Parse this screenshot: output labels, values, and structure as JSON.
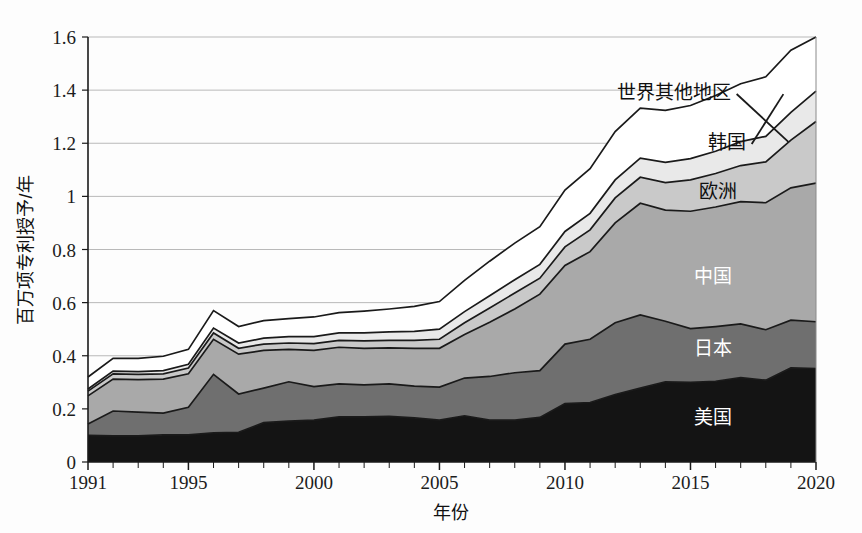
{
  "chart_data": {
    "type": "area",
    "stacked": true,
    "title": "",
    "subtitle": "",
    "xlabel": "年份",
    "ylabel": "百万项专利授予/年",
    "xlim": [
      1991,
      2020
    ],
    "ylim": [
      0,
      1.6
    ],
    "grid": true,
    "legend_position": "inline-annotations",
    "x": [
      1991,
      1992,
      1993,
      1994,
      1995,
      1996,
      1997,
      1998,
      1999,
      2000,
      2001,
      2002,
      2003,
      2004,
      2005,
      2006,
      2007,
      2008,
      2009,
      2010,
      2011,
      2012,
      2013,
      2014,
      2015,
      2016,
      2017,
      2018,
      2019,
      2020
    ],
    "xticks": [
      1991,
      1995,
      2000,
      2005,
      2010,
      2015,
      2020
    ],
    "xtick_labels": [
      "1991",
      "1995",
      "2000",
      "2005",
      "2010",
      "2015",
      "2020"
    ],
    "yticks": [
      0,
      0.2,
      0.4,
      0.6,
      0.8,
      1,
      1.2,
      1.4,
      1.6
    ],
    "ytick_labels": [
      "0",
      "0.2",
      "0.4",
      "0.6",
      "0.8",
      "1",
      "1.2",
      "1.4",
      "1.6"
    ],
    "series": [
      {
        "name": "美国",
        "color": "#141414",
        "label_color": "#ffffff",
        "values": [
          0.1,
          0.098,
          0.098,
          0.102,
          0.102,
          0.11,
          0.112,
          0.148,
          0.154,
          0.158,
          0.17,
          0.17,
          0.172,
          0.166,
          0.158,
          0.174,
          0.158,
          0.158,
          0.168,
          0.22,
          0.224,
          0.254,
          0.278,
          0.302,
          0.3,
          0.304,
          0.318,
          0.308,
          0.354,
          0.352
        ]
      },
      {
        "name": "日本",
        "color": "#6f6f6f",
        "label_color": "#ffffff",
        "values": [
          0.043,
          0.094,
          0.09,
          0.082,
          0.104,
          0.22,
          0.144,
          0.13,
          0.148,
          0.126,
          0.124,
          0.12,
          0.122,
          0.12,
          0.124,
          0.142,
          0.164,
          0.178,
          0.176,
          0.224,
          0.238,
          0.27,
          0.276,
          0.228,
          0.202,
          0.206,
          0.202,
          0.19,
          0.18,
          0.176
        ]
      },
      {
        "name": "中国",
        "color": "#a9a9a9",
        "label_color": "#ffffff",
        "values": [
          0.106,
          0.12,
          0.122,
          0.128,
          0.126,
          0.132,
          0.15,
          0.142,
          0.122,
          0.136,
          0.138,
          0.138,
          0.136,
          0.142,
          0.146,
          0.164,
          0.204,
          0.24,
          0.288,
          0.296,
          0.33,
          0.376,
          0.42,
          0.418,
          0.442,
          0.45,
          0.46,
          0.478,
          0.498,
          0.522
        ]
      },
      {
        "name": "欧洲",
        "color": "#c9c9c9",
        "label_color": "#101010",
        "values": [
          0.018,
          0.02,
          0.02,
          0.02,
          0.022,
          0.024,
          0.022,
          0.024,
          0.024,
          0.026,
          0.026,
          0.028,
          0.028,
          0.03,
          0.034,
          0.044,
          0.054,
          0.06,
          0.06,
          0.07,
          0.082,
          0.094,
          0.098,
          0.104,
          0.118,
          0.126,
          0.136,
          0.154,
          0.18,
          0.232
        ]
      },
      {
        "name": "韩国",
        "color": "#e9e9e9",
        "label_color": "#101010",
        "values": [
          0.008,
          0.01,
          0.01,
          0.012,
          0.014,
          0.018,
          0.02,
          0.022,
          0.024,
          0.026,
          0.028,
          0.03,
          0.032,
          0.034,
          0.038,
          0.042,
          0.046,
          0.05,
          0.052,
          0.058,
          0.062,
          0.068,
          0.072,
          0.076,
          0.08,
          0.084,
          0.09,
          0.096,
          0.104,
          0.114
        ]
      },
      {
        "name": "世界其他地区",
        "color": "#ffffff",
        "label_color": "#101010",
        "values": [
          0.045,
          0.048,
          0.05,
          0.054,
          0.056,
          0.066,
          0.062,
          0.066,
          0.068,
          0.074,
          0.076,
          0.082,
          0.086,
          0.094,
          0.104,
          0.118,
          0.13,
          0.138,
          0.142,
          0.156,
          0.168,
          0.182,
          0.188,
          0.196,
          0.2,
          0.21,
          0.218,
          0.224,
          0.234,
          0.204
        ]
      }
    ],
    "annotations": [
      {
        "text": "世界其他地区",
        "anchor_x": 2016.6,
        "anchor_y": 1.393
      },
      {
        "text": "韩国",
        "anchor_x": 2017.2,
        "anchor_y": 1.205
      },
      {
        "text": "欧洲",
        "anchor_x": 2016.1,
        "anchor_y": 1.02
      },
      {
        "text": "中国",
        "anchor_x": 2015.9,
        "anchor_y": 0.7
      },
      {
        "text": "日本",
        "anchor_x": 2015.9,
        "anchor_y": 0.43
      },
      {
        "text": "美国",
        "anchor_x": 2015.9,
        "anchor_y": 0.17
      }
    ]
  },
  "axes": {
    "y_title": "百万项专利授予/年",
    "x_title": "年份",
    "y_labels": [
      "1.6",
      "1.4",
      "1.2",
      "1",
      "0.8",
      "0.6",
      "0.4",
      "0.2",
      "0"
    ],
    "x_labels": [
      "1991",
      "1995",
      "2000",
      "2005",
      "2010",
      "2015",
      "2020"
    ]
  },
  "labels": {
    "rest_of_world": "世界其他地区",
    "south_korea": "韩国",
    "europe": "欧洲",
    "china": "中国",
    "japan": "日本",
    "usa": "美国"
  }
}
